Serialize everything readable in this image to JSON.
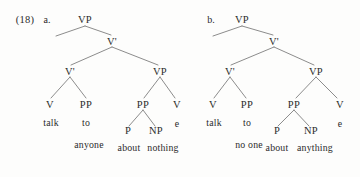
{
  "figure": {
    "example_number": "(18)",
    "ink_color": "#2b2b2b",
    "background_color": "#fdfdfc",
    "line_color": "#6e6e6e"
  },
  "trees": [
    {
      "letter": "a.",
      "nodes": {
        "root": "VP",
        "vbar_upper": "V'",
        "vbar_lower": "V'",
        "vp_right": "VP",
        "v_head": "V",
        "pp_left": "PP",
        "pp_inner": "PP",
        "v_empty_cat": "V",
        "p": "P",
        "np": "NP"
      },
      "terminals": {
        "v_head_word": "talk",
        "pp_left_word": "to",
        "pp_left_complement": "anyone",
        "p_word": "about",
        "np_word": "nothing",
        "empty_word": "e"
      }
    },
    {
      "letter": "b.",
      "nodes": {
        "root": "VP",
        "vbar_upper": "V'",
        "vbar_lower": "V'",
        "vp_right": "VP",
        "v_head": "V",
        "pp_left": "PP",
        "pp_inner": "PP",
        "v_empty_cat": "V",
        "p": "P",
        "np": "NP"
      },
      "terminals": {
        "v_head_word": "talk",
        "pp_left_word": "to",
        "pp_left_complement": "no one",
        "p_word": "about",
        "np_word": "anything",
        "empty_word": "e"
      }
    }
  ]
}
